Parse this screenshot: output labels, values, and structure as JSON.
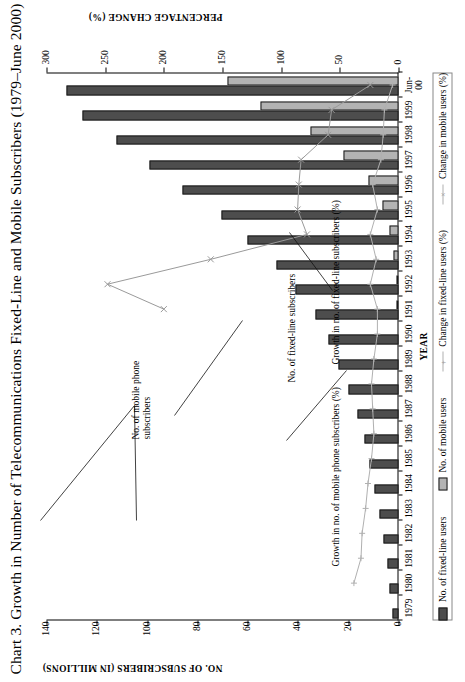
{
  "figure": {
    "title": "Chart 3.  Growth in Number of Telecommunications Fixed-Line and Mobile Subscribers (1979–June 2000)"
  },
  "axes": {
    "left_title": "NO. OF SUBSCRIBERS (IN MILLIONS)",
    "right_title": "PERCENTAGE CHANGE (%)",
    "x_title": "YEAR"
  },
  "legend": {
    "items": [
      {
        "label": "No. of fixed-line users",
        "type": "bar",
        "color": "#4d4d4d"
      },
      {
        "label": "No. of mobile users",
        "type": "bar",
        "color": "#b3b3b3"
      },
      {
        "label": "Change in fixed-line users (%)",
        "type": "line",
        "color": "#b0b0b0",
        "marker": "+"
      },
      {
        "label": "Change in mobile users (%)",
        "type": "line",
        "color": "#b0b0b0",
        "marker": "×"
      }
    ]
  },
  "callouts": [
    {
      "id": "mobile-bars",
      "text": "No. of mobile phone\nsubscribers"
    },
    {
      "id": "fixed-bars",
      "text": "No. of fixed-line subscribers"
    },
    {
      "id": "mobile-growth",
      "text": "Growth in no. of mobile phone subscribers (%)"
    },
    {
      "id": "fixed-growth",
      "text": "Growth in no. of fixed-line subscribers (%)"
    }
  ],
  "chart_data": {
    "type": "bar",
    "title": "Chart 3.  Growth in Number of Telecommunications Fixed-Line and Mobile Subscribers (1979–June 2000)",
    "xlabel": "YEAR",
    "ylabel": "NO. OF SUBSCRIBERS (IN MILLIONS)",
    "y2label": "PERCENTAGE CHANGE (%)",
    "ylim": [
      0,
      140
    ],
    "y2lim": [
      0,
      300
    ],
    "yticks": [
      0,
      20,
      40,
      60,
      80,
      100,
      120,
      140
    ],
    "y2ticks": [
      0,
      50,
      100,
      150,
      200,
      250,
      300
    ],
    "grid": false,
    "legend_position": "bottom",
    "categories": [
      "1979",
      "1980",
      "1981",
      "1982",
      "1983",
      "1984",
      "1985",
      "1986",
      "1987",
      "1988",
      "1989",
      "1990",
      "1991",
      "1992",
      "1993",
      "1994",
      "1995",
      "1996",
      "1997",
      "1998",
      "1999",
      "Jun-00"
    ],
    "series": [
      {
        "name": "No. of fixed-line users",
        "type": "bar",
        "axis": "left",
        "unit": "millions",
        "color": "#4d4d4d",
        "values": [
          2.5,
          3.5,
          4.5,
          6.0,
          7.5,
          9.5,
          11.5,
          13.5,
          16.5,
          20.0,
          24.0,
          28.0,
          33.0,
          41.0,
          48.5,
          60.0,
          70.5,
          86.0,
          99.0,
          112.0,
          125.5,
          132.0
        ]
      },
      {
        "name": "No. of mobile users",
        "type": "bar",
        "axis": "left",
        "unit": "millions",
        "color": "#b3b3b3",
        "values": [
          0,
          0,
          0,
          0,
          0,
          0,
          0,
          0,
          0,
          0,
          0,
          0,
          0.5,
          1.0,
          2.0,
          3.5,
          6.5,
          12.0,
          22.0,
          35.0,
          55.0,
          68.0
        ]
      },
      {
        "name": "Change in fixed-line users (%)",
        "type": "line",
        "axis": "right",
        "unit": "%",
        "color": "#b0b0b0",
        "marker": "+",
        "values": [
          null,
          38,
          32,
          31,
          28,
          26,
          23,
          21,
          22,
          23,
          21,
          18,
          18,
          24,
          19,
          24,
          18,
          22,
          15,
          13,
          12,
          5
        ]
      },
      {
        "name": "Change in mobile users (%)",
        "type": "line",
        "axis": "right",
        "unit": "%",
        "color": "#9a9a9a",
        "marker": "×",
        "values": [
          null,
          null,
          null,
          null,
          null,
          null,
          null,
          null,
          null,
          null,
          null,
          null,
          200,
          248,
          160,
          78,
          86,
          85,
          83,
          60,
          57,
          24
        ]
      }
    ]
  }
}
